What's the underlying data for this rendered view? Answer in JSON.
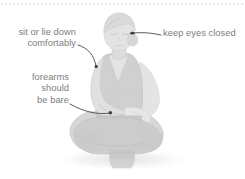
{
  "illustration": {
    "alt_name": "seated-meditation-figure",
    "description": "Grayscale illustration of a woman sitting cross-legged with eyes closed, wearing a sleeveless V-neck top",
    "colors": {
      "skin": "#e2e2e2",
      "skin_shadow": "#d3d3d3",
      "garment": "#cfcfcf",
      "garment_shadow": "#c2c2c2",
      "hair": "#dcdcdc",
      "hair_shadow": "#cfcfcf",
      "outline": "#c9c9c9",
      "text": "#7d7d7d",
      "leader_line": "#4a4a4a",
      "rule": "#e9e9e9",
      "background": "#ffffff"
    }
  },
  "annotations": {
    "sit_or_lie": {
      "lines": [
        "sit or lie down",
        "comfortably"
      ],
      "line1": "sit or lie down",
      "line2": "comfortably"
    },
    "keep_eyes_closed": {
      "text": "keep eyes closed"
    },
    "forearms": {
      "lines": [
        "forearms",
        "should",
        "be bare"
      ],
      "line1": "forearms",
      "line2": "should",
      "line3": "be bare"
    }
  }
}
